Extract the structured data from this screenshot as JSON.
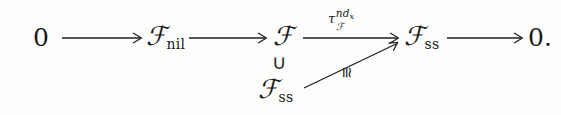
{
  "figure": {
    "kind": "commutative-diagram",
    "background_color": "#fdfdfc",
    "ink_color": "#1b1b1b"
  },
  "sequence": {
    "terms": [
      {
        "id": "zero-left",
        "text": "0"
      },
      {
        "id": "f-nil",
        "base": "ℱ",
        "subscript": "nil"
      },
      {
        "id": "f-mid",
        "base": "ℱ",
        "subscript": ""
      },
      {
        "id": "f-ss-top",
        "base": "ℱ",
        "subscript": "ss"
      },
      {
        "id": "zero-right",
        "text": "0."
      }
    ]
  },
  "lower": {
    "containment_symbol": "∪",
    "term": {
      "base": "ℱ",
      "subscript": "ss"
    }
  },
  "labels": {
    "tau": {
      "base": "τ",
      "superscript_main": "nd",
      "superscript_sub": "x",
      "subscript": "ℱ",
      "plain": "τ_ℱ^{nd_x}"
    },
    "iso": {
      "symbol": "≅",
      "plain": "congruent"
    }
  },
  "arrows": [
    {
      "id": "arrow-1",
      "from": "zero-left",
      "to": "f-nil",
      "style": "solid",
      "label": ""
    },
    {
      "id": "arrow-2",
      "from": "f-nil",
      "to": "f-mid",
      "style": "solid",
      "label": ""
    },
    {
      "id": "arrow-3",
      "from": "f-mid",
      "to": "f-ss-top",
      "style": "solid",
      "label": "tau"
    },
    {
      "id": "arrow-4",
      "from": "f-ss-top",
      "to": "zero-right",
      "style": "solid",
      "label": ""
    },
    {
      "id": "arrow-diagonal",
      "from": "f-ss-bottom",
      "to": "f-ss-top",
      "style": "solid",
      "label": "iso"
    }
  ]
}
